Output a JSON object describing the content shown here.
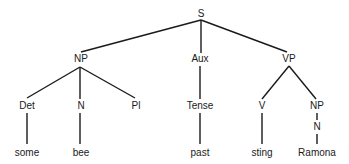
{
  "diagram": {
    "type": "syntax-tree",
    "line_color": "#1a1a1a",
    "nodes": [
      {
        "id": "S",
        "label": "S",
        "x": 201,
        "y": 14
      },
      {
        "id": "NP1",
        "label": "NP",
        "x": 81,
        "y": 59
      },
      {
        "id": "Aux",
        "label": "Aux",
        "x": 200,
        "y": 59
      },
      {
        "id": "VP",
        "label": "VP",
        "x": 289,
        "y": 59
      },
      {
        "id": "Det",
        "label": "Det",
        "x": 27,
        "y": 106
      },
      {
        "id": "N1",
        "label": "N",
        "x": 81,
        "y": 106
      },
      {
        "id": "Pl",
        "label": "Pl",
        "x": 136,
        "y": 106
      },
      {
        "id": "Tense",
        "label": "Tense",
        "x": 200,
        "y": 106
      },
      {
        "id": "V",
        "label": "V",
        "x": 262,
        "y": 106
      },
      {
        "id": "NP2",
        "label": "NP",
        "x": 317,
        "y": 106
      },
      {
        "id": "N2",
        "label": "N",
        "x": 317,
        "y": 127
      },
      {
        "id": "some",
        "label": "some",
        "x": 27,
        "y": 153
      },
      {
        "id": "bee",
        "label": "bee",
        "x": 81,
        "y": 153
      },
      {
        "id": "past",
        "label": "past",
        "x": 200,
        "y": 153
      },
      {
        "id": "sting",
        "label": "sting",
        "x": 262,
        "y": 153
      },
      {
        "id": "Ramona",
        "label": "Ramona",
        "x": 317,
        "y": 153
      }
    ],
    "edges": [
      {
        "from": "S",
        "to": "NP1",
        "x1": 201,
        "y1": 20,
        "x2": 81,
        "y2": 52
      },
      {
        "from": "S",
        "to": "Aux",
        "x1": 201,
        "y1": 20,
        "x2": 201,
        "y2": 53
      },
      {
        "from": "S",
        "to": "VP",
        "x1": 201,
        "y1": 20,
        "x2": 287,
        "y2": 52
      },
      {
        "from": "NP1",
        "to": "Det",
        "x1": 80,
        "y1": 67,
        "x2": 27,
        "y2": 98
      },
      {
        "from": "NP1",
        "to": "N1",
        "x1": 80,
        "y1": 67,
        "x2": 80,
        "y2": 99
      },
      {
        "from": "NP1",
        "to": "Pl",
        "x1": 80,
        "y1": 67,
        "x2": 135,
        "y2": 98
      },
      {
        "from": "Aux",
        "to": "Tense",
        "x1": 200,
        "y1": 66,
        "x2": 200,
        "y2": 99
      },
      {
        "from": "VP",
        "to": "V",
        "x1": 289,
        "y1": 66,
        "x2": 262,
        "y2": 99
      },
      {
        "from": "VP",
        "to": "NP2",
        "x1": 289,
        "y1": 66,
        "x2": 316,
        "y2": 99
      },
      {
        "from": "NP2",
        "to": "N2",
        "x1": 317,
        "y1": 113,
        "x2": 317,
        "y2": 120
      },
      {
        "from": "N2",
        "to": "Ramona",
        "x1": 317,
        "y1": 134,
        "x2": 317,
        "y2": 144
      },
      {
        "from": "Det",
        "to": "some",
        "x1": 27,
        "y1": 113,
        "x2": 27,
        "y2": 144
      },
      {
        "from": "N1",
        "to": "bee",
        "x1": 80,
        "y1": 113,
        "x2": 80,
        "y2": 144
      },
      {
        "from": "Tense",
        "to": "past",
        "x1": 200,
        "y1": 113,
        "x2": 200,
        "y2": 144
      },
      {
        "from": "V",
        "to": "sting",
        "x1": 262,
        "y1": 113,
        "x2": 262,
        "y2": 144
      }
    ]
  }
}
